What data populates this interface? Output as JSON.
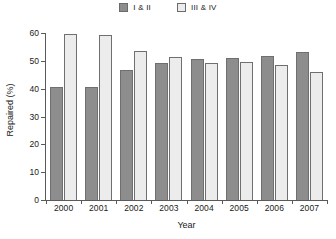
{
  "chart_data": {
    "type": "bar",
    "title": "",
    "xlabel": "Year",
    "ylabel": "Repaired (%)",
    "categories": [
      "2000",
      "2001",
      "2002",
      "2003",
      "2004",
      "2005",
      "2006",
      "2007"
    ],
    "series": [
      {
        "name": "I & II",
        "color": "#8d8d8d",
        "values": [
          40.7,
          40.7,
          46.8,
          49.3,
          50.6,
          51.1,
          51.6,
          53.2
        ]
      },
      {
        "name": "III & IV",
        "color": "#ececec",
        "values": [
          59.7,
          59.4,
          53.5,
          51.5,
          49.4,
          49.5,
          48.6,
          46.0
        ]
      }
    ],
    "ylim": [
      0,
      60
    ],
    "yticks": [
      0,
      10,
      20,
      30,
      40,
      50,
      60
    ],
    "ytick_labels": [
      "0",
      "10",
      "20",
      "30",
      "40",
      "50",
      "60"
    ],
    "grid": false,
    "legend_position": "top-center"
  },
  "legend": {
    "items": [
      {
        "label": "I & II"
      },
      {
        "label": "III & IV"
      }
    ]
  }
}
